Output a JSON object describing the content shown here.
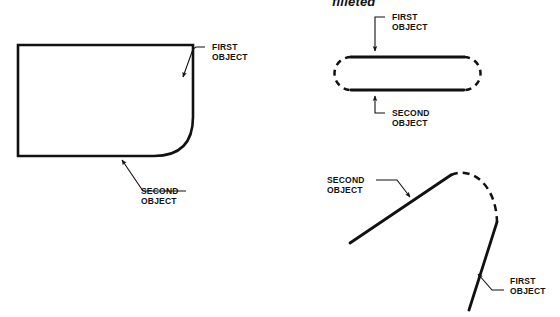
{
  "page": {
    "background_color": "#ffffff",
    "line_color": "#111111",
    "width": 560,
    "height": 317
  },
  "heading": {
    "text": "filleted",
    "clipped_at_top": true
  },
  "figures": [
    {
      "id": "rectangle-with-fillet",
      "name": "left-figure",
      "labels": [
        {
          "id": "first-object",
          "line1": "FIRST",
          "line2": "OBJECT"
        },
        {
          "id": "second-object",
          "line1": "SECOND",
          "line2": "OBJECT"
        }
      ]
    },
    {
      "id": "stadium-with-dashed-caps",
      "name": "top-right-figure",
      "labels": [
        {
          "id": "first-object",
          "line1": "FIRST",
          "line2": "OBJECT"
        },
        {
          "id": "second-object",
          "line1": "SECOND",
          "line2": "OBJECT"
        }
      ]
    },
    {
      "id": "two-lines-dashed-arc",
      "name": "bottom-right-figure",
      "labels": [
        {
          "id": "second-object",
          "line1": "SECOND",
          "line2": "OBJECT"
        },
        {
          "id": "first-object",
          "line1": "FIRST",
          "line2": "OBJECT"
        }
      ]
    }
  ],
  "labels": {
    "left_first_l1": "FIRST",
    "left_first_l2": "OBJECT",
    "left_second_l1": "SECOND",
    "left_second_l2": "OBJECT",
    "tr_first_l1": "FIRST",
    "tr_first_l2": "OBJECT",
    "tr_second_l1": "SECOND",
    "tr_second_l2": "OBJECT",
    "br_second_l1": "SECOND",
    "br_second_l2": "OBJECT",
    "br_first_l1": "FIRST",
    "br_first_l2": "OBJECT"
  }
}
